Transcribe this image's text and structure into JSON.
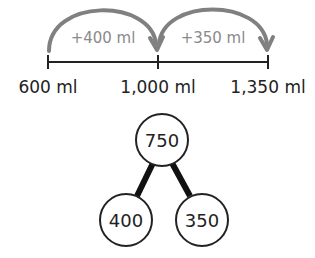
{
  "number_line": {
    "ticks": [
      {
        "label": "600 ml",
        "x": 48
      },
      {
        "label": "1,000 ml",
        "x": 158
      },
      {
        "label": "1,350 ml",
        "x": 268
      }
    ],
    "jumps": [
      {
        "label": "+400 ml",
        "from": "600 ml",
        "to": "1,000 ml"
      },
      {
        "label": "+350 ml",
        "from": "1,000 ml",
        "to": "1,350 ml"
      }
    ],
    "arrow_color": "#808080",
    "line_color": "#222222"
  },
  "part_whole": {
    "whole": "750",
    "parts": [
      "400",
      "350"
    ]
  }
}
